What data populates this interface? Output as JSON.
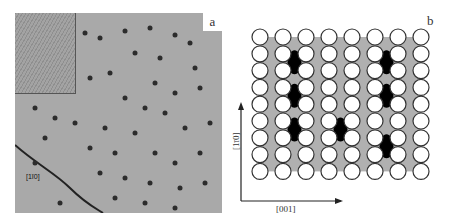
{
  "figure": {
    "panel_a": {
      "label": "a",
      "direction_label": "[1ī0]",
      "description": "STM image with dark adsorbate features and a step edge; upper-left inset with atomic rows"
    },
    "panel_b": {
      "label": "b",
      "axis_vertical": "[1ī0]",
      "axis_horizontal": "[001]",
      "lattice": {
        "columns": 8,
        "rows": 9,
        "circle_color": "#ffffff",
        "interstitial_color": "#b0b0b0",
        "adsorbate_color": "#000000"
      }
    }
  }
}
